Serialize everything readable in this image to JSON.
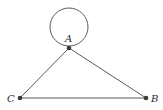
{
  "diagram": {
    "type": "graph",
    "vertices": [
      {
        "id": "A",
        "label": "A",
        "x": 69,
        "y": 48,
        "label_x": 65,
        "label_y": 42
      },
      {
        "id": "B",
        "label": "B",
        "x": 146,
        "y": 98,
        "label_x": 151,
        "label_y": 102
      },
      {
        "id": "C",
        "label": "C",
        "x": 20,
        "y": 98,
        "label_x": 7,
        "label_y": 102
      }
    ],
    "edges": [
      {
        "from": "A",
        "to": "A",
        "kind": "loop"
      },
      {
        "from": "A",
        "to": "C"
      },
      {
        "from": "A",
        "to": "B"
      },
      {
        "from": "C",
        "to": "B"
      }
    ],
    "colors": {
      "edge": "#5a5a5a",
      "vertex": "#3a3a3a",
      "label": "#2a2a2a"
    }
  }
}
